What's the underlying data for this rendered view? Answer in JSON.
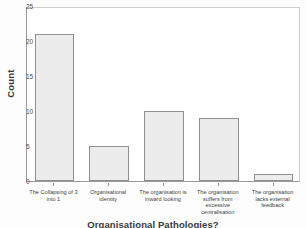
{
  "chart_data": {
    "type": "bar",
    "title": "",
    "xlabel": "Organisational Pathologies?",
    "ylabel": "Count",
    "ylim": [
      0,
      25
    ],
    "yticks": [
      0,
      5,
      10,
      15,
      20,
      25
    ],
    "ytick_labels": [
      "0",
      "5",
      "10",
      "15",
      "20",
      "25"
    ],
    "grid": false,
    "legend": null,
    "categories": [
      "The Collapsing of 3 into 1",
      "Organisational identity",
      "The organisation is inward looking",
      "The organisation suffers from excessive centralisation",
      "The organisation lacks external feedback"
    ],
    "values": [
      21,
      5,
      10,
      9,
      1
    ],
    "bar_fill": "#ececec",
    "bar_edge": "#8f8f8f",
    "axis_color": "#9a9a9a",
    "frame_color": "#cfcfcf"
  }
}
